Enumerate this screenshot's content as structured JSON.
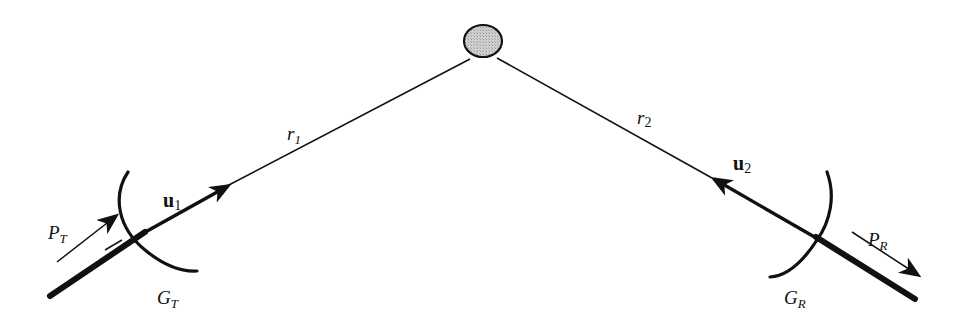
{
  "diagram": {
    "type": "bistatic-radar-geometry",
    "colors": {
      "stroke": "#111111",
      "target_fill": "#c8c8c8",
      "background": "#ffffff"
    },
    "target": {
      "shape": "ellipse",
      "description": "scattering target"
    },
    "paths": {
      "r1": {
        "main": "r",
        "sub": "1"
      },
      "r2": {
        "main": "r",
        "sub": "2"
      }
    },
    "transmitter": {
      "gain": {
        "main": "G",
        "sub": "T"
      },
      "power": {
        "main": "P",
        "sub": "T"
      },
      "unit_vector": {
        "main": "u",
        "sub": "1"
      }
    },
    "receiver": {
      "gain": {
        "main": "G",
        "sub": "R"
      },
      "power": {
        "main": "P",
        "sub": "R"
      },
      "unit_vector": {
        "main": "u",
        "sub": "2"
      }
    }
  }
}
